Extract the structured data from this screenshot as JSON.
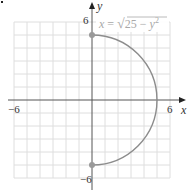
{
  "chart_data": {
    "type": "line",
    "title": "",
    "xlabel": "x",
    "ylabel": "y",
    "xlim": [
      -6,
      6
    ],
    "ylim": [
      -6,
      6
    ],
    "grid": true,
    "x_tick_labels": [
      "−6",
      "6"
    ],
    "y_tick_labels": [
      "6",
      "−6"
    ],
    "series": [
      {
        "name": "x = √(25 − y²)",
        "equation": "x = sqrt(25 - y^2)",
        "description": "right semicircle of radius 5 centered at origin",
        "points": [
          [
            0,
            5
          ],
          [
            3,
            4
          ],
          [
            4,
            3
          ],
          [
            5,
            0
          ],
          [
            4,
            -3
          ],
          [
            3,
            -4
          ],
          [
            0,
            -5
          ]
        ],
        "endpoints": [
          [
            0,
            5
          ],
          [
            0,
            -5
          ]
        ]
      }
    ],
    "annotations": [
      {
        "text": "x = √(25 − y²)",
        "position": "top, right of y-axis"
      }
    ]
  },
  "labels": {
    "x_axis": "x",
    "y_axis": "y",
    "x_min": "−6",
    "x_max": "6",
    "y_max": "6",
    "y_min": "−6",
    "eq_lhs": "x",
    "eq_eq": " = ",
    "eq_sqrt_body": "25 − ",
    "eq_y": "y",
    "eq_exp": "2"
  },
  "colors": {
    "grid": "#dedede",
    "axis": "#555555",
    "curve": "#8c8c8c",
    "endpoint": "#9a9a9a",
    "equation": "#a8a8a8"
  }
}
